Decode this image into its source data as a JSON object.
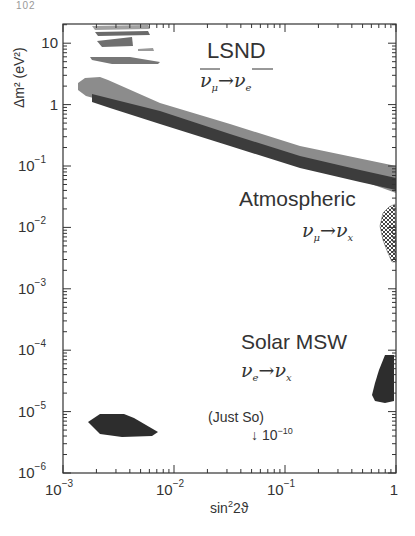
{
  "page": {
    "number": "102"
  },
  "chart_data": {
    "type": "area",
    "title": "",
    "xlabel": "sin²2ϑ",
    "ylabel": "Δm² (eV²)",
    "xscale": "log",
    "yscale": "log",
    "xlim": [
      0.001,
      1
    ],
    "ylim": [
      1e-06,
      20
    ],
    "grid": false,
    "x_ticks": [
      {
        "value": 0.001,
        "label": "10",
        "exp": "−3"
      },
      {
        "value": 0.01,
        "label": "10",
        "exp": "−2"
      },
      {
        "value": 0.1,
        "label": "10",
        "exp": "−1"
      },
      {
        "value": 1,
        "label": "1",
        "exp": ""
      }
    ],
    "y_ticks": [
      {
        "value": 1e-06,
        "label": "10",
        "exp": "−6"
      },
      {
        "value": 1e-05,
        "label": "10",
        "exp": "−5"
      },
      {
        "value": 0.0001,
        "label": "10",
        "exp": "−4"
      },
      {
        "value": 0.001,
        "label": "10",
        "exp": "−3"
      },
      {
        "value": 0.01,
        "label": "10",
        "exp": "−2"
      },
      {
        "value": 0.1,
        "label": "10",
        "exp": "−1"
      },
      {
        "value": 1,
        "label": "1",
        "exp": ""
      },
      {
        "value": 10,
        "label": "10",
        "exp": ""
      }
    ],
    "regions": [
      {
        "name": "LSND (90% CL, outer)",
        "style": "light-gray",
        "color": "#8a8a8a",
        "approx_band": {
          "sin2_2theta": [
            0.0018,
            1
          ],
          "dm2_at_left": [
            0.8,
            1.8
          ],
          "dm2_at_right": [
            0.03,
            0.07
          ]
        }
      },
      {
        "name": "LSND (inner, dark)",
        "style": "dark-gray",
        "color": "#3a3a3a",
        "approx_band": {
          "sin2_2theta": [
            0.003,
            1
          ],
          "dm2_at_left": [
            0.7,
            1.0
          ],
          "dm2_at_right": [
            0.035,
            0.065
          ]
        }
      },
      {
        "name": "LSND high-Δm² islands",
        "style": "light-gray",
        "color": "#8a8a8a",
        "approx_dm2": [
          5,
          7,
          10,
          12,
          18
        ]
      },
      {
        "name": "Atmospheric",
        "style": "hatched",
        "color": "#555555",
        "approx_range": {
          "sin2_2theta": [
            0.8,
            1
          ],
          "dm2": [
            0.0015,
            0.015
          ]
        }
      },
      {
        "name": "Solar MSW (large angle)",
        "style": "dark",
        "color": "#2b2b2b",
        "approx_range": {
          "sin2_2theta": [
            0.6,
            1
          ],
          "dm2": [
            1.5e-05,
            0.00015
          ]
        }
      },
      {
        "name": "Solar MSW (small angle)",
        "style": "dark",
        "color": "#2b2b2b",
        "approx_range": {
          "sin2_2theta": [
            0.002,
            0.01
          ],
          "dm2": [
            4e-06,
            9e-06
          ]
        }
      }
    ],
    "annotations": [
      {
        "id": "lsnd",
        "title": "LSND",
        "reaction_from": "ν",
        "from_sub": "μ",
        "reaction_to": "ν",
        "to_sub": "e",
        "overline": true
      },
      {
        "id": "atm",
        "title": "Atmospheric",
        "reaction_from": "ν",
        "from_sub": "μ",
        "reaction_to": "ν",
        "to_sub": "x",
        "overline": false
      },
      {
        "id": "solar",
        "title": "Solar MSW",
        "reaction_from": "ν",
        "from_sub": "e",
        "reaction_to": "ν",
        "to_sub": "x",
        "overline": false
      },
      {
        "id": "justso",
        "title": "(Just So)",
        "arrow": "↓",
        "value": "10",
        "exp": "−10"
      }
    ]
  },
  "labels": {
    "xlabel_main": "sin",
    "xlabel_sup": "2",
    "xlabel_rest": "2ϑ",
    "ylabel": "Δm² (eV²)",
    "lsnd_title": "LSND",
    "atm_title": "Atmospheric",
    "solar_title": "Solar MSW",
    "justso_title": "(Just So)",
    "justso_arrow": "↓ 10",
    "justso_exp": "−10",
    "nu": "ν",
    "arrow": "→",
    "sub_mu": "μ",
    "sub_e": "e",
    "sub_x": "x"
  }
}
